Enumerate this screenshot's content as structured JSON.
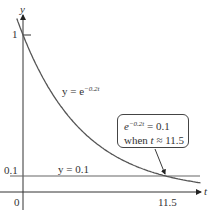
{
  "chart_data": {
    "type": "line",
    "title": "",
    "xlabel": "t",
    "ylabel": "y",
    "xlim": [
      -1.8,
      14.4
    ],
    "ylim": [
      -0.12,
      1.15
    ],
    "grid": false,
    "x_ticks": [
      {
        "value": 0,
        "label": "0"
      },
      {
        "value": 11.5,
        "label": "11.5"
      }
    ],
    "y_ticks": [
      {
        "value": 0.1,
        "label": "0.1"
      },
      {
        "value": 1,
        "label": "1"
      }
    ],
    "series": [
      {
        "name": "y = e^{-0.2t}",
        "function": "exp(-0.2*t)",
        "x": [
          -0.5,
          0,
          1,
          2,
          3,
          4,
          5,
          6,
          7,
          8,
          9,
          10,
          11,
          11.5,
          12,
          13,
          14
        ],
        "values": [
          1.105,
          1.0,
          0.819,
          0.67,
          0.549,
          0.449,
          0.368,
          0.301,
          0.247,
          0.202,
          0.165,
          0.135,
          0.111,
          0.1,
          0.091,
          0.074,
          0.061
        ]
      },
      {
        "name": "y = 0.1",
        "function": "0.1",
        "x": [
          0,
          14
        ],
        "values": [
          0.1,
          0.1
        ]
      }
    ],
    "annotations": [
      {
        "text": "e^{-0.2t} = 0.1 when t ≈ 11.5",
        "points_to": [
          11.5,
          0.1
        ],
        "style": "rounded box with arrow"
      }
    ],
    "labels": {
      "y_axis": "y",
      "t_axis": "t",
      "origin": "0",
      "tick_one": "1",
      "tick_point_one": "0.1",
      "tick_eleven_five": "11.5",
      "curve_label_prefix": "y = e",
      "curve_label_exp": "−0.2t",
      "line_label": "y = 0.1",
      "callout_line1_base": "e",
      "callout_line1_exp": "−0.2t",
      "callout_line1_rest": " = 0.1",
      "callout_line2_prefix": "when ",
      "callout_line2_var": "t",
      "callout_line2_rest": " ≈ 11.5"
    },
    "colors": {
      "curve": "#555555",
      "axes": "#333333",
      "hline": "#666666"
    }
  }
}
